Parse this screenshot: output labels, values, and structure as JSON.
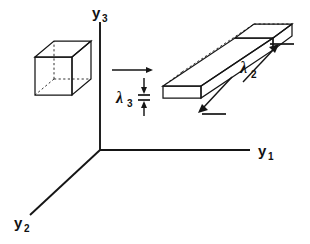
{
  "figure": {
    "background_color": "#ffffff",
    "ink_color": "#151515",
    "width": 310,
    "height": 244
  },
  "axes": {
    "origin": {
      "x": 100,
      "y": 150
    },
    "items": [
      {
        "id": "y1",
        "name": "y1-axis",
        "label_base": "y",
        "label_sub": "1",
        "direction": "right",
        "label_x": 258,
        "label_y": 156,
        "from": {
          "x": 100,
          "y": 150
        },
        "to": {
          "x": 250,
          "y": 150
        }
      },
      {
        "id": "y2",
        "name": "y2-axis",
        "label_base": "y",
        "label_sub": "2",
        "direction": "down-left",
        "label_x": 14,
        "label_y": 228,
        "from": {
          "x": 100,
          "y": 150
        },
        "to": {
          "x": 30,
          "y": 215
        }
      },
      {
        "id": "y3",
        "name": "y3-axis",
        "label_base": "y",
        "label_sub": "3",
        "direction": "up",
        "label_x": 92,
        "label_y": 18,
        "from": {
          "x": 100,
          "y": 150
        },
        "to": {
          "x": 100,
          "y": 22
        }
      }
    ]
  },
  "shapes": {
    "cube": {
      "name": "undeformed-cube",
      "description": "undeformed unit cube drawn with dashed hidden edges",
      "front_face": {
        "left": 35,
        "top": 57,
        "width": 37,
        "height": 38
      },
      "depth_offset": {
        "dx": 19,
        "dy": -16
      }
    },
    "slab": {
      "name": "deformed-slab",
      "description": "elongated thin slab extended along y2 and compressed along y3",
      "near_face": {
        "left": 163,
        "top": 86,
        "width": 38,
        "height": 12
      },
      "length_offset": {
        "dx": 72,
        "dy": -48
      },
      "depth_offset": {
        "dx": 19,
        "dy": -14
      }
    }
  },
  "annotations": {
    "transform_arrow": {
      "name": "transformation-arrow",
      "from": {
        "x": 112,
        "y": 70
      },
      "to": {
        "x": 152,
        "y": 70
      }
    },
    "lambda3": {
      "label_base": "λ",
      "label_sub": "3",
      "label_x": 116,
      "label_y": 103,
      "meaning": "thickness stretch ratio along y3",
      "dimension": {
        "x": 144,
        "top": 78,
        "bottom": 114,
        "mid_top": 94,
        "mid_bottom": 99,
        "tick_half_width": 6
      }
    },
    "lambda2": {
      "label_base": "λ",
      "label_sub": "2",
      "label_x": 240,
      "label_y": 73,
      "meaning": "length stretch ratio along y2",
      "upper_arrow": {
        "from": {
          "x": 243,
          "y": 82
        },
        "to": {
          "x": 278,
          "y": 45
        }
      },
      "upper_tick": {
        "from": {
          "x": 270,
          "y": 44
        },
        "to": {
          "x": 294,
          "y": 44
        }
      },
      "lower_arrow": {
        "from": {
          "x": 232,
          "y": 77
        },
        "to": {
          "x": 198,
          "y": 113
        }
      },
      "lower_tick": {
        "from": {
          "x": 202,
          "y": 114
        },
        "to": {
          "x": 226,
          "y": 114
        }
      }
    }
  }
}
